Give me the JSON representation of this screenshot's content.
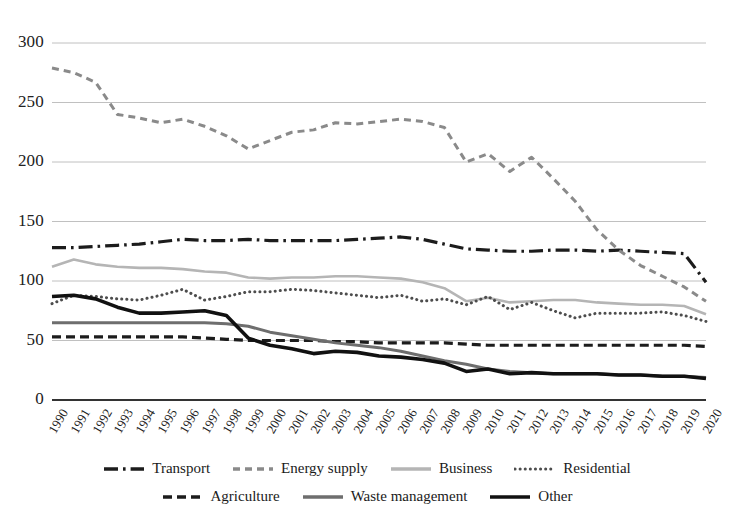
{
  "chart_data": {
    "type": "line",
    "title": "",
    "xlabel": "",
    "ylabel": "",
    "ylim": [
      0,
      300
    ],
    "yticks": [
      0,
      50,
      100,
      150,
      200,
      250,
      300
    ],
    "grid": true,
    "legend_position": "bottom",
    "x": [
      1990,
      1991,
      1992,
      1993,
      1994,
      1995,
      1996,
      1997,
      1998,
      1999,
      2000,
      2001,
      2002,
      2003,
      2004,
      2005,
      2006,
      2007,
      2008,
      2009,
      2010,
      2011,
      2012,
      2013,
      2014,
      2015,
      2016,
      2017,
      2018,
      2019,
      2020
    ],
    "categories": [
      "1990",
      "1991",
      "1992",
      "1993",
      "1994",
      "1995",
      "1996",
      "1997",
      "1998",
      "1999",
      "2000",
      "2001",
      "2002",
      "2003",
      "2004",
      "2005",
      "2006",
      "2007",
      "2008",
      "2009",
      "2010",
      "2011",
      "2012",
      "2013",
      "2014",
      "2015",
      "2016",
      "2017",
      "2018",
      "2019",
      "2020"
    ],
    "series": [
      {
        "name": "Transport",
        "style": "dashdot",
        "color": "#1c1c1c",
        "width": 3.2,
        "values": [
          128,
          128,
          129,
          130,
          131,
          133,
          135,
          134,
          134,
          135,
          134,
          134,
          134,
          134,
          135,
          136,
          137,
          135,
          131,
          127,
          126,
          125,
          125,
          126,
          126,
          125,
          126,
          125,
          124,
          123,
          99
        ]
      },
      {
        "name": "Energy supply",
        "style": "dotted-dash",
        "color": "#8a8a8a",
        "width": 3.0,
        "values": [
          279,
          275,
          267,
          240,
          237,
          233,
          236,
          230,
          222,
          211,
          218,
          225,
          227,
          233,
          232,
          234,
          236,
          234,
          229,
          200,
          207,
          192,
          204,
          186,
          167,
          143,
          126,
          113,
          104,
          95,
          83
        ]
      },
      {
        "name": "Business",
        "style": "solid",
        "color": "#b5b5b5",
        "width": 2.6,
        "values": [
          112,
          118,
          114,
          112,
          111,
          111,
          110,
          108,
          107,
          103,
          102,
          103,
          103,
          104,
          104,
          103,
          102,
          99,
          94,
          83,
          86,
          82,
          83,
          84,
          84,
          82,
          81,
          80,
          80,
          79,
          72
        ]
      },
      {
        "name": "Residential",
        "style": "dotted",
        "color": "#4d4d4d",
        "width": 3.0,
        "values": [
          81,
          88,
          87,
          85,
          84,
          88,
          93,
          84,
          87,
          91,
          91,
          93,
          92,
          90,
          88,
          86,
          88,
          83,
          85,
          80,
          87,
          76,
          82,
          75,
          69,
          73,
          73,
          73,
          74,
          71,
          66
        ]
      },
      {
        "name": "Agriculture",
        "style": "dashed",
        "color": "#1c1c1c",
        "width": 3.2,
        "values": [
          53,
          53,
          53,
          53,
          53,
          53,
          53,
          52,
          51,
          50,
          50,
          50,
          50,
          49,
          49,
          48,
          48,
          48,
          48,
          47,
          46,
          46,
          46,
          46,
          46,
          46,
          46,
          46,
          46,
          46,
          45
        ]
      },
      {
        "name": "Waste management",
        "style": "solid",
        "color": "#6e6e6e",
        "width": 3.0,
        "values": [
          65,
          65,
          65,
          65,
          65,
          65,
          65,
          65,
          64,
          62,
          57,
          54,
          51,
          48,
          46,
          44,
          41,
          37,
          33,
          30,
          26,
          24,
          23,
          22,
          22,
          22,
          21,
          21,
          20,
          20,
          19
        ]
      },
      {
        "name": "Other",
        "style": "solid",
        "color": "#111111",
        "width": 3.6,
        "values": [
          87,
          88,
          85,
          78,
          73,
          73,
          74,
          75,
          71,
          52,
          46,
          43,
          39,
          41,
          40,
          37,
          36,
          34,
          31,
          24,
          26,
          22,
          23,
          22,
          22,
          22,
          21,
          21,
          20,
          20,
          18
        ]
      }
    ]
  },
  "legend": {
    "row1": [
      {
        "label": "Transport",
        "style": "dashdot",
        "color": "#1c1c1c"
      },
      {
        "label": "Energy supply",
        "style": "dotted-dash",
        "color": "#8a8a8a"
      },
      {
        "label": "Business",
        "style": "solid",
        "color": "#b5b5b5"
      },
      {
        "label": "Residential",
        "style": "dotted",
        "color": "#4d4d4d"
      }
    ],
    "row2": [
      {
        "label": "Agriculture",
        "style": "dashed",
        "color": "#1c1c1c"
      },
      {
        "label": "Waste management",
        "style": "solid",
        "color": "#6e6e6e"
      },
      {
        "label": "Other",
        "style": "solid",
        "color": "#111111"
      }
    ]
  },
  "axis": {
    "grid_color": "#b9b9b9",
    "baseline_color": "#333333"
  }
}
